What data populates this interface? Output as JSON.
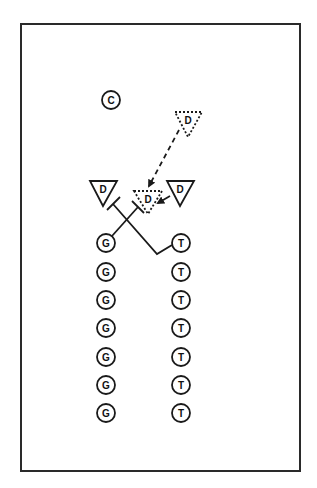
{
  "diagram": {
    "type": "drill-diagram",
    "colors": {
      "stroke": "#1a1a1a",
      "background": "#ffffff",
      "border": "#2a2a2a"
    },
    "field": {
      "x": 21,
      "y": 24,
      "width": 279,
      "height": 447
    },
    "coach": {
      "label": "C",
      "x": 111,
      "y": 100
    },
    "defenders": [
      {
        "id": "d-left",
        "label": "D",
        "x": 103,
        "y": 189,
        "style": "solid"
      },
      {
        "id": "d-right",
        "label": "D",
        "x": 180,
        "y": 190,
        "style": "solid"
      },
      {
        "id": "d-start",
        "label": "D",
        "x": 188,
        "y": 121,
        "style": "dotted"
      },
      {
        "id": "d-end",
        "label": "D",
        "x": 148,
        "y": 199,
        "style": "dotted"
      }
    ],
    "guards_column": {
      "label": "G",
      "x": 106,
      "ys": [
        243,
        272,
        300,
        328,
        357,
        385,
        413
      ]
    },
    "tackles_column": {
      "label": "T",
      "x": 181,
      "ys": [
        243,
        272,
        300,
        328,
        357,
        385,
        413
      ]
    },
    "routes": [
      {
        "id": "g-block",
        "from": "G1",
        "to": "d-end",
        "style": "solid",
        "end": "block"
      },
      {
        "id": "t-block",
        "from": "T1",
        "to": "d-left",
        "style": "solid",
        "end": "block"
      },
      {
        "id": "d-drop",
        "from": "d-start",
        "to": "d-end",
        "style": "dashed",
        "end": "arrow"
      },
      {
        "id": "d-slide",
        "from": "d-right",
        "to": "d-end",
        "style": "solid",
        "end": "arrow"
      }
    ]
  }
}
